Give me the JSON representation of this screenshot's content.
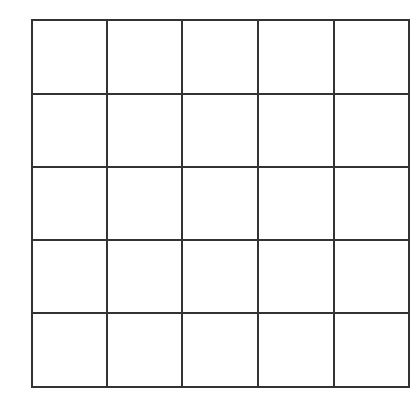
{
  "diagram": {
    "type": "grid",
    "rows": 5,
    "cols": 5,
    "line_color": "#333333",
    "background": "#ffffff",
    "line_width": 2,
    "x_lines": [
      32,
      107,
      182,
      258,
      334,
      409
    ],
    "y_lines": [
      20,
      94,
      167,
      240,
      313,
      387
    ]
  }
}
